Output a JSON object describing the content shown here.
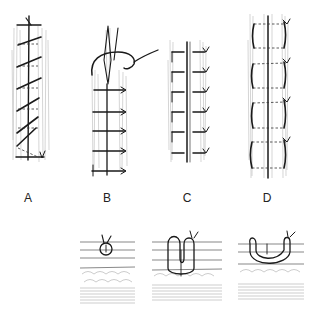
{
  "figure": {
    "panels": [
      {
        "id": "A",
        "label": "A",
        "technique": "continuous over-and-over (running) suture"
      },
      {
        "id": "B",
        "label": "B",
        "technique": "continuous locked (blanket) suture with needle and thread"
      },
      {
        "id": "C",
        "label": "C",
        "technique": "interrupted simple sutures"
      },
      {
        "id": "D",
        "label": "D",
        "technique": "interrupted mattress sutures"
      }
    ],
    "cross_sections": [
      {
        "id": "simple",
        "description": "simple suture loop in skin cross-section"
      },
      {
        "id": "vertical-mattress",
        "description": "vertical mattress suture cross-section"
      },
      {
        "id": "horizontal-mattress",
        "description": "horizontal/half-buried mattress suture cross-section"
      }
    ],
    "colors": {
      "ink": "#1a1a1a",
      "hatching": "#b9b9b9",
      "background": "#ffffff"
    }
  }
}
